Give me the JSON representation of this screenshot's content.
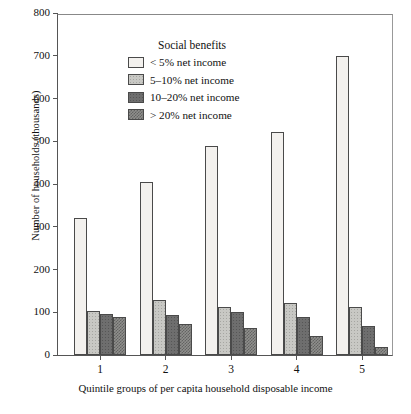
{
  "chart_data": {
    "type": "bar",
    "title": "",
    "xlabel": "Quintile groups of per capita household disposable income",
    "ylabel": "Number of households (thousands)",
    "categories": [
      "1",
      "2",
      "3",
      "4",
      "5"
    ],
    "ylim": [
      0,
      800
    ],
    "yticks": [
      0,
      100,
      200,
      300,
      400,
      500,
      600,
      700,
      800
    ],
    "ytick_labels": [
      "0",
      "100",
      "200",
      "300",
      "400",
      "500",
      "600",
      "700",
      "800"
    ],
    "grid": false,
    "legend_position": "upper-left-inside",
    "legend_title": "Social benefits",
    "series": [
      {
        "name": "< 5% net income",
        "pattern": "light-dotted",
        "values": [
          320,
          405,
          490,
          522,
          700
        ]
      },
      {
        "name": "5–10% net income",
        "pattern": "light-grey",
        "values": [
          103,
          128,
          112,
          122,
          113
        ]
      },
      {
        "name": "10–20% net income",
        "pattern": "dark-grey",
        "values": [
          96,
          93,
          100,
          88,
          67
        ]
      },
      {
        "name": "> 20% net income",
        "pattern": "checker-grey",
        "values": [
          90,
          72,
          63,
          44,
          18
        ]
      }
    ]
  },
  "legend": {
    "title": "Social benefits",
    "items": [
      {
        "label": "< 5% net income"
      },
      {
        "label": "5–10% net income"
      },
      {
        "label": "10–20% net income"
      },
      {
        "label": "> 20% net income"
      }
    ]
  }
}
